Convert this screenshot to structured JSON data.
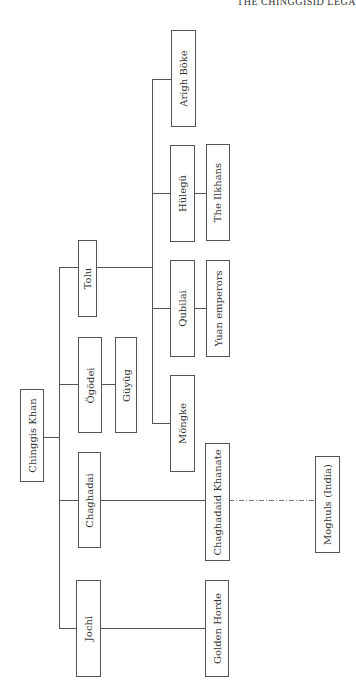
{
  "header": {
    "running_title": "THE CHINGGISID LEGA"
  },
  "diagram": {
    "type": "genealogy-tree",
    "orientation": "rotated-90",
    "root": "Chinggis Khan",
    "nodes": {
      "chinggis_khan": "Chinggis Khan",
      "jochi": "Jochi",
      "chaghadai": "Chaghadai",
      "ogodei": "Ögödei",
      "tolu": "Tolu",
      "guyug": "Güyüg",
      "mongke": "Möngke",
      "qubilai": "Qubilai",
      "hulegu": "Hülegü",
      "arigh_boke": "Arigh Böke",
      "golden_horde": "Golden Horde",
      "chaghadaid_khanate": "Chaghadaid Khanate",
      "moghuls": "Moghuls (India)",
      "yuan_emperors": "Yuan emperors",
      "ilkhans": "The Ilkhans"
    },
    "edges": [
      {
        "from": "Chinggis Khan",
        "to": "Jochi",
        "style": "solid"
      },
      {
        "from": "Chinggis Khan",
        "to": "Chaghadai",
        "style": "solid"
      },
      {
        "from": "Chinggis Khan",
        "to": "Ögödei",
        "style": "solid"
      },
      {
        "from": "Chinggis Khan",
        "to": "Tolu",
        "style": "solid"
      },
      {
        "from": "Ögödei",
        "to": "Güyüg",
        "style": "solid"
      },
      {
        "from": "Tolu",
        "to": "Möngke",
        "style": "solid"
      },
      {
        "from": "Tolu",
        "to": "Qubilai",
        "style": "solid"
      },
      {
        "from": "Tolu",
        "to": "Hülegü",
        "style": "solid"
      },
      {
        "from": "Tolu",
        "to": "Arigh Böke",
        "style": "solid"
      },
      {
        "from": "Jochi",
        "to": "Golden Horde",
        "style": "solid"
      },
      {
        "from": "Chaghadai",
        "to": "Chaghadaid Khanate",
        "style": "solid"
      },
      {
        "from": "Chaghadaid Khanate",
        "to": "Moghuls (India)",
        "style": "dash-dot"
      },
      {
        "from": "Qubilai",
        "to": "Yuan emperors",
        "style": "solid"
      },
      {
        "from": "Hülegü",
        "to": "The Ilkhans",
        "style": "solid"
      }
    ]
  }
}
